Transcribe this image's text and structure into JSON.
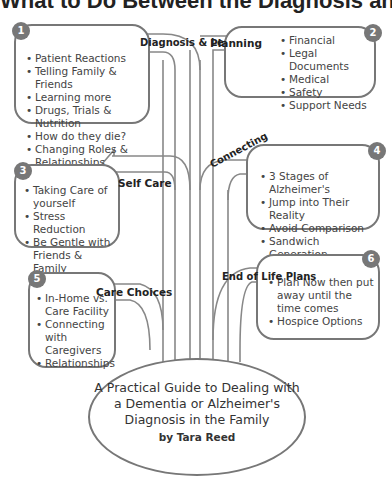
{
  "title": "What to Do Between the Diagnosis and the End",
  "branches": [
    {
      "number": "1",
      "label": "Diagnosis & Learning",
      "items": [
        "Patient Reactions",
        "Telling Family & Friends",
        "Learning more",
        "Drugs, Trials & Nutrition",
        "How do they die?",
        "Changing Roles & Relationships"
      ]
    },
    {
      "number": "2",
      "label": "Planning",
      "items": [
        "Financial",
        "Legal Documents",
        "Medical",
        "Safety",
        "Support Needs"
      ]
    },
    {
      "number": "3",
      "label": "Self Care",
      "items": [
        "Taking Care of yourself",
        "Stress Reduction",
        "Be Gentle with Friends & Family"
      ]
    },
    {
      "number": "4",
      "label": "Connecting",
      "items": [
        "3 Stages of Alzheimer's",
        "Jump into Their Reality",
        "Avoid Comparison",
        "Sandwich Generation"
      ]
    },
    {
      "number": "5",
      "label": "Care Choices",
      "items": [
        "In-Home vs. Care Facility",
        "Connecting with Caregivers",
        "Relationships"
      ]
    },
    {
      "number": "6",
      "label": "End of Life Plans",
      "items": [
        "Plan Now then put away until the time comes",
        "Hospice Options"
      ]
    }
  ],
  "center": {
    "guide_title": "A Practical Guide to Dealing with a Dementia or Alzheimer's Diagnosis in the Family",
    "author": "by Tara Reed"
  },
  "colors": {
    "stroke": "#777777",
    "badge": "#777777",
    "text": "#333333"
  }
}
